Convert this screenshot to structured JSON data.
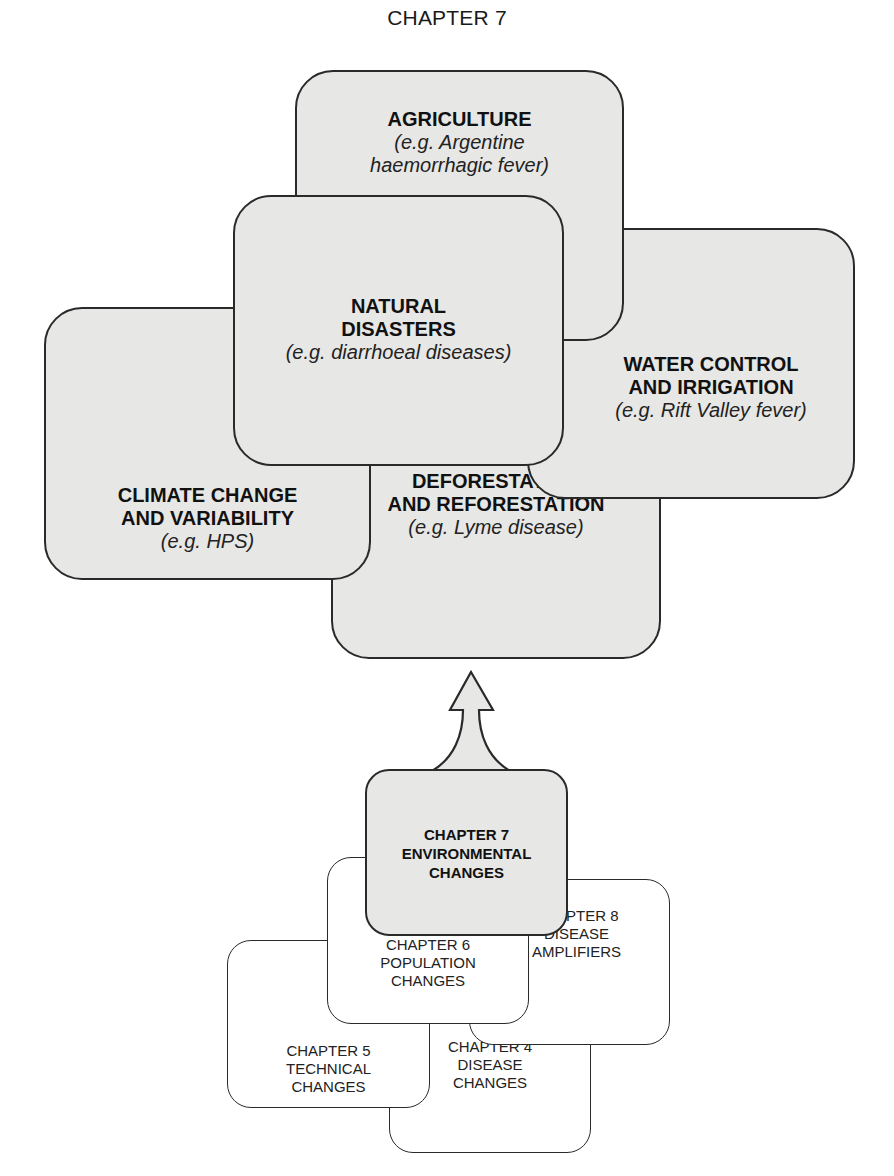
{
  "title": "CHAPTER 7",
  "colors": {
    "box_fill": "#e7e7e5",
    "outline": "#2a2a2a",
    "white_fill": "#ffffff"
  },
  "factors": {
    "agriculture": {
      "heading": [
        "AGRICULTURE"
      ],
      "example": [
        "(e.g. Argentine",
        "haemorrhagic fever)"
      ]
    },
    "natural": {
      "heading": [
        "NATURAL",
        "DISASTERS"
      ],
      "example": [
        "(e.g. diarrhoeal diseases)"
      ]
    },
    "water": {
      "heading": [
        "WATER CONTROL",
        "AND IRRIGATION"
      ],
      "example": [
        "(e.g. Rift Valley fever)"
      ]
    },
    "climate": {
      "heading": [
        "CLIMATE CHANGE",
        "AND VARIABILITY"
      ],
      "example": [
        "(e.g. HPS)"
      ]
    },
    "deforestation": {
      "heading": [
        "DEFORESTATION",
        "AND REFORESTATION"
      ],
      "example": [
        "(e.g. Lyme disease)"
      ]
    }
  },
  "chapters": {
    "ch7": [
      "CHAPTER 7",
      "ENVIRONMENTAL",
      "CHANGES"
    ],
    "ch6": [
      "CHAPTER 6",
      "POPULATION",
      "CHANGES"
    ],
    "ch8": [
      "CHAPTER 8",
      "DISEASE",
      "AMPLIFIERS"
    ],
    "ch5": [
      "CHAPTER 5",
      "TECHNICAL",
      "CHANGES"
    ],
    "ch4": [
      "CHAPTER 4",
      "DISEASE",
      "CHANGES"
    ]
  },
  "arrow": {
    "direction": "up",
    "label": ""
  }
}
